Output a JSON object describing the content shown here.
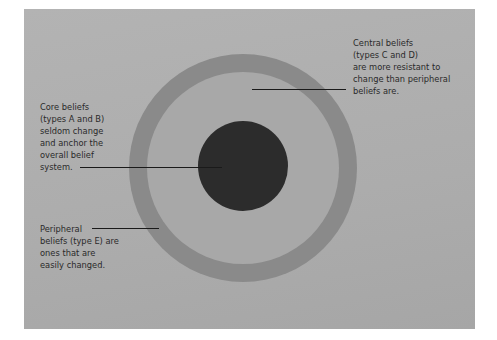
{
  "diagram": {
    "type": "concentric-circles",
    "title": "",
    "colors": {
      "background": "#b0b0b0",
      "peripheral_ring": "#8a8a8a",
      "central_disk": "#a8a8a8",
      "core": "#2c2c2c",
      "text": "#2a2a2a"
    },
    "layers": [
      {
        "id": "core",
        "name": "Core beliefs",
        "types": "A and B"
      },
      {
        "id": "central",
        "name": "Central beliefs",
        "types": "C and D"
      },
      {
        "id": "peripheral",
        "name": "Peripheral beliefs",
        "types": "E"
      }
    ],
    "labels": {
      "central": "Central beliefs\n(types C and D)\nare more resistant to\nchange than peripheral\nbeliefs are.",
      "core": "Core beliefs\n(types A and B)\nseldom change\nand anchor the\noverall belief\nsystem.",
      "peripheral": "Peripheral\nbeliefs (type E) are\nones that are\neasily changed."
    }
  }
}
